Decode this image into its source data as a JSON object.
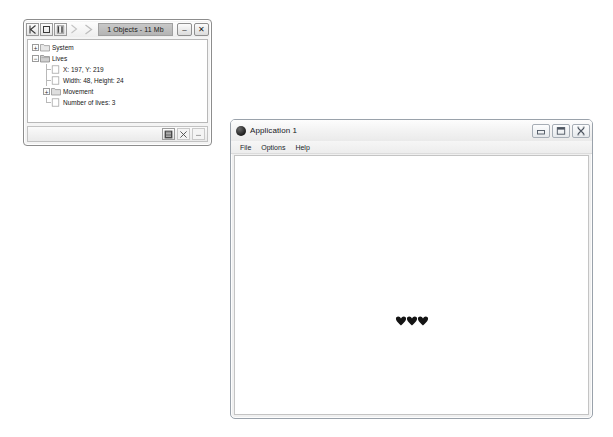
{
  "inspector": {
    "title": "1 Objects - 11 Mb",
    "toolbar": [
      {
        "name": "skip-back-icon",
        "enabled": true
      },
      {
        "name": "stop-icon",
        "enabled": true
      },
      {
        "name": "pause-icon",
        "enabled": true
      },
      {
        "name": "step-forward-icon",
        "enabled": false
      },
      {
        "name": "play-icon",
        "enabled": false
      }
    ],
    "window_buttons": {
      "minimize_label": "–",
      "close_label": "✕"
    },
    "tree": [
      {
        "label": "System",
        "depth": 1,
        "expander": "+",
        "icon": "folder-icon"
      },
      {
        "label": "Lives",
        "depth": 1,
        "expander": "-",
        "icon": "folder-open-icon"
      },
      {
        "label": "X: 197, Y: 219",
        "depth": 2,
        "expander": "",
        "icon": "property-icon"
      },
      {
        "label": "Width: 48, Height: 24",
        "depth": 2,
        "expander": "",
        "icon": "property-icon"
      },
      {
        "label": "Movement",
        "depth": 2,
        "expander": "+",
        "icon": "folder-icon"
      },
      {
        "label": "Number of lives: 3",
        "depth": 2,
        "expander": "",
        "icon": "property-icon"
      }
    ],
    "status_buttons": [
      {
        "name": "properties-icon"
      },
      {
        "name": "delete-icon"
      },
      {
        "name": "more-options-icon"
      }
    ]
  },
  "application": {
    "title": "Application 1",
    "icon": "app-circle-icon",
    "menus": [
      {
        "label": "File"
      },
      {
        "label": "Options"
      },
      {
        "label": "Help"
      }
    ],
    "window_buttons": {
      "minimize_name": "minimize-icon",
      "maximize_name": "maximize-icon",
      "close_name": "close-icon"
    },
    "canvas": {
      "lives_count": 3,
      "sprite_name": "heart-sprite",
      "sprite_color": "#141414"
    }
  }
}
